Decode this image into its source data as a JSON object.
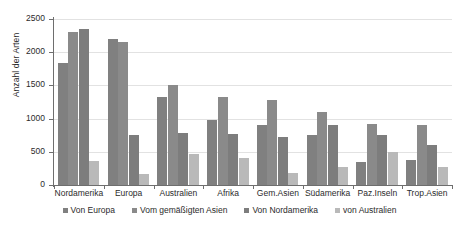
{
  "chart_data": {
    "type": "bar",
    "title": "",
    "subtitle": "",
    "xlabel": "",
    "ylabel": "Anzahl der Arten",
    "ylim": [
      0,
      2500
    ],
    "yticks": [
      0,
      500,
      1000,
      1500,
      2000,
      2500
    ],
    "grid": true,
    "legend_position": "bottom",
    "categories": [
      "Nordamerika",
      "Europa",
      "Australien",
      "Afrika",
      "Gem.Asien",
      "Südamerika",
      "Paz.Inseln",
      "Trop.Asien"
    ],
    "series": [
      {
        "name": "Von Europa",
        "color": "#808080",
        "values": [
          1840,
          2205,
          1320,
          980,
          910,
          760,
          345,
          380
        ]
      },
      {
        "name": "Vom gemäßigten Asien",
        "color": "#8a8a8a",
        "values": [
          2300,
          2160,
          1510,
          1320,
          1285,
          1100,
          915,
          910
        ]
      },
      {
        "name": "Von Nordamerika",
        "color": "#7d7d7d",
        "values": [
          2355,
          760,
          780,
          770,
          730,
          900,
          760,
          600
        ]
      },
      {
        "name": "von Australien",
        "color": "#b9b9b9",
        "values": [
          360,
          160,
          470,
          400,
          180,
          275,
          490,
          265
        ]
      }
    ]
  },
  "axis": {
    "y_title": "Anzahl der Arten"
  },
  "colors": {
    "series_1": "#808080",
    "series_2": "#8a8a8a",
    "series_3": "#7d7d7d",
    "series_4": "#b9b9b9",
    "grid": "#e2e2e2",
    "axis": "#6e6e6e",
    "text": "#2b2b2b",
    "background": "#ffffff"
  }
}
